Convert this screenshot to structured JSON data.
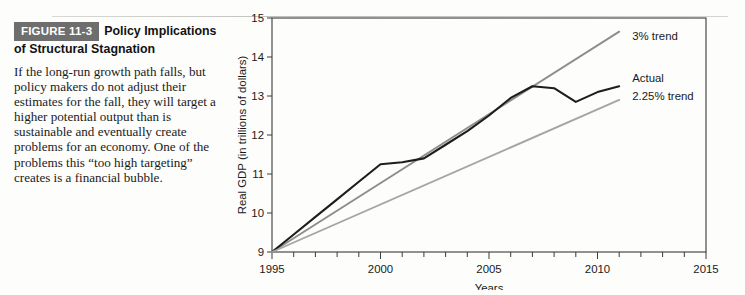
{
  "figure": {
    "badge": "FIGURE 11-3",
    "title_line1": "Policy Implications",
    "title_line2": "of Structural Stagnation",
    "caption": "If the long-run growth path falls, but policy makers do not adjust their estimates for the fall, they will target a higher potential output than is sustainable and eventually create problems for an economy. One of the problems this “too high targeting” creates is a financial bubble."
  },
  "chart_data": {
    "type": "line",
    "title": "",
    "xlabel": "Years",
    "ylabel": "Real GDP (in trillions of dollars)",
    "xlim": [
      1995,
      2015
    ],
    "ylim": [
      9,
      15
    ],
    "xticks": [
      1995,
      2000,
      2005,
      2010,
      2015
    ],
    "xtick_labels": [
      "1995",
      "2000",
      "2005",
      "2010",
      "2015"
    ],
    "x_minor_step": 1,
    "yticks": [
      9,
      10,
      11,
      12,
      13,
      14,
      15
    ],
    "ytick_labels": [
      "9",
      "10",
      "11",
      "12",
      "13",
      "14",
      "15"
    ],
    "grid": false,
    "legend_position": "inline-right",
    "series": [
      {
        "name": "3% trend",
        "label": "3% trend",
        "color": "#8d8d8d",
        "x": [
          1995,
          2011
        ],
        "values": [
          9.0,
          14.65
        ],
        "label_x": 2011.6,
        "label_y": 14.55
      },
      {
        "name": "Actual",
        "label": "Actual",
        "color": "#1d1d1d",
        "x": [
          1995,
          1996,
          1997,
          1998,
          1999,
          2000,
          2001,
          2002,
          2003,
          2004,
          2005,
          2006,
          2007,
          2008,
          2009,
          2010,
          2011
        ],
        "values": [
          9.0,
          9.45,
          9.9,
          10.35,
          10.8,
          11.25,
          11.3,
          11.4,
          11.75,
          12.1,
          12.5,
          12.95,
          13.25,
          13.2,
          12.85,
          13.1,
          13.25
        ],
        "label_x": 2011.6,
        "label_y": 13.45
      },
      {
        "name": "2.25% trend",
        "label": "2.25% trend",
        "color": "#a5a5a5",
        "x": [
          1995,
          2011
        ],
        "values": [
          9.0,
          12.9
        ],
        "label_x": 2011.6,
        "label_y": 13.0
      }
    ]
  }
}
